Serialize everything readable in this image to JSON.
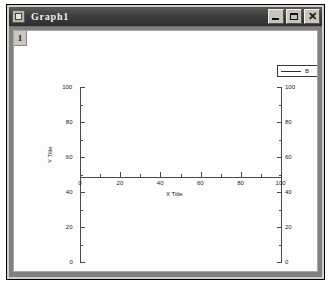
{
  "window": {
    "title": "Graph1",
    "icon": "graph-window-icon",
    "controls": {
      "minimize": "–",
      "maximize": "□",
      "close": "✕"
    }
  },
  "graph": {
    "layer_badge": "1",
    "legend": {
      "label": "B",
      "line_color": "#2c2c2c"
    }
  },
  "chart_data": {
    "type": "line",
    "title": "",
    "series": [
      {
        "name": "B",
        "x": [],
        "y": []
      }
    ],
    "xlabel": "X Title",
    "ylabel": "Y Title",
    "ylabel_right": "Y Title",
    "xlim": [
      0,
      100
    ],
    "ylim": [
      0,
      100
    ],
    "ylim_right": [
      0,
      100
    ],
    "xticks": [
      "0",
      "20",
      "40",
      "60",
      "80",
      "100"
    ],
    "yticks": [
      "0",
      "20",
      "40",
      "60",
      "80",
      "100"
    ],
    "yticks_right": [
      "0",
      "20",
      "40",
      "60",
      "80",
      "100"
    ],
    "grid": false,
    "legend_position": "top-right",
    "minor_ticks": true
  }
}
